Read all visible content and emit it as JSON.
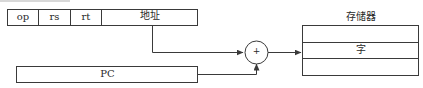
{
  "diagram": {
    "instruction": {
      "fields": [
        {
          "label": "op"
        },
        {
          "label": "rs"
        },
        {
          "label": "rt"
        },
        {
          "label": "地址"
        }
      ]
    },
    "pc": {
      "label": "PC"
    },
    "adder": {
      "symbol": "+"
    },
    "memory": {
      "title": "存储器",
      "cells": [
        {
          "label": ""
        },
        {
          "label": "字"
        },
        {
          "label": ""
        }
      ]
    },
    "colors": {
      "stroke": "#3a3a3a",
      "text": "#2a2a2a",
      "background": "#ffffff"
    }
  }
}
